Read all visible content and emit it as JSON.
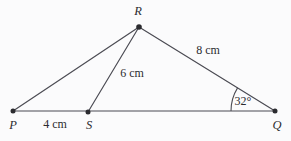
{
  "figure": {
    "type": "geometry-diagram",
    "background_color": "#fbfbfc",
    "stroke_color": "#4a4a52",
    "text_color": "#2b2b2f",
    "vertices": [
      {
        "name": "P",
        "label": "P",
        "x": 13,
        "y": 111,
        "label_x": 13,
        "label_y": 125
      },
      {
        "name": "S",
        "label": "S",
        "x": 88,
        "y": 112,
        "label_x": 89,
        "label_y": 125
      },
      {
        "name": "Q",
        "label": "Q",
        "x": 275,
        "y": 111,
        "label_x": 277,
        "label_y": 125
      },
      {
        "name": "R",
        "label": "R",
        "x": 139,
        "y": 27,
        "label_x": 138,
        "label_y": 11
      }
    ],
    "segments": [
      {
        "name": "PQ",
        "from": "P",
        "to": "Q"
      },
      {
        "name": "PR",
        "from": "P",
        "to": "R"
      },
      {
        "name": "SR",
        "from": "S",
        "to": "R"
      },
      {
        "name": "RQ",
        "from": "R",
        "to": "Q"
      }
    ],
    "measurements": [
      {
        "name": "PS",
        "label": "4 cm",
        "x": 55,
        "y": 124
      },
      {
        "name": "SR",
        "label": "6 cm",
        "x": 132,
        "y": 73
      },
      {
        "name": "RQ",
        "label": "8 cm",
        "x": 208,
        "y": 50
      }
    ],
    "angles": [
      {
        "name": "RQP",
        "label": "32°",
        "vertex": "Q",
        "x": 243,
        "y": 101,
        "arc_radius": 44
      }
    ]
  }
}
